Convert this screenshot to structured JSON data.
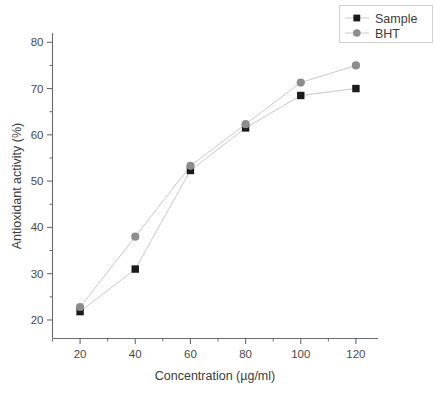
{
  "chart_data": {
    "type": "line",
    "title": "",
    "xlabel": "Concentration (µg/ml)",
    "ylabel": "Antioxidant activity (%)",
    "x": [
      20,
      40,
      60,
      80,
      100,
      120
    ],
    "xlim": [
      10,
      128
    ],
    "ylim": [
      16,
      82
    ],
    "xticks": [
      20,
      40,
      60,
      80,
      100,
      120
    ],
    "yticks": [
      20,
      30,
      40,
      50,
      60,
      70,
      80
    ],
    "xtick_labels": [
      "20",
      "40",
      "60",
      "80",
      "100",
      "120"
    ],
    "ytick_labels": [
      "20",
      "30",
      "40",
      "50",
      "60",
      "70",
      "80"
    ],
    "grid": false,
    "legend_position": "top-right",
    "series": [
      {
        "name": "Sample",
        "marker": "square",
        "color": "#1a1a1a",
        "line_color": "#c9c9c9",
        "values": [
          21.8,
          31.0,
          52.3,
          61.5,
          68.5,
          70.0
        ]
      },
      {
        "name": "BHT",
        "marker": "circle",
        "color": "#8d8d8d",
        "line_color": "#c9c9c9",
        "values": [
          22.8,
          38.0,
          53.3,
          62.3,
          71.3,
          75.0
        ]
      }
    ]
  },
  "legend": {
    "entries": [
      {
        "label": "Sample"
      },
      {
        "label": "BHT"
      }
    ]
  },
  "axes": {
    "x_title": "Concentration (µg/ml)",
    "y_title": "Antioxidant activity (%)"
  },
  "colors": {
    "sample": "#1a1a1a",
    "bht": "#8d8d8d",
    "line": "#c9c9c9",
    "axis": "#6b6b6b",
    "background": "#ffffff"
  }
}
